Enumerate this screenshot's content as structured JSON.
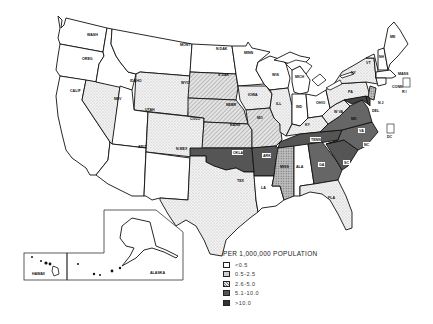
{
  "map": {
    "legend": {
      "title": "PER 1,000,000 POPULATION",
      "classes": [
        {
          "label": "<0.5",
          "fill": "#ffffff",
          "pattern": "blank"
        },
        {
          "label": "0.5-2.5",
          "fill": "#e6e6e6",
          "pattern": "light-dots"
        },
        {
          "label": "2.6-5.0",
          "fill": "#cfcfcf",
          "pattern": "diagonal-hatch"
        },
        {
          "label": "5.1-10.0",
          "fill": "#a8a8a8",
          "pattern": "dense-dots"
        },
        {
          "label": ">10.0",
          "fill": "#555555",
          "pattern": "dark-solid"
        }
      ]
    },
    "state_labels": {
      "WASH": "WASH",
      "OREG": "OREG",
      "CALIF": "CALIF",
      "NEV": "NEV",
      "IDAHO": "IDAHO",
      "MONT": "MONT",
      "WYO": "WYO",
      "UTAH": "UTAH",
      "ARIZ": "ARIZ",
      "COLO": "COLO",
      "NMEX": "N MEX",
      "NDAK": "N DAK",
      "SDAK": "S DAK",
      "NEBR": "NEBR",
      "KANS": "KANS",
      "OKLA": "OKLA",
      "TEX": "TEX",
      "MINN": "MINN",
      "IOWA": "IOWA",
      "MO": "MO",
      "ARK": "ARK",
      "LA": "LA",
      "WIS": "WIS",
      "ILL": "ILL",
      "MICH": "MICH",
      "IND": "IND",
      "OHIO": "OHIO",
      "KY": "KY",
      "TENN": "TENN",
      "MISS": "MISS",
      "ALA": "ALA",
      "GA": "GA",
      "FLA": "FLA",
      "SC": "SC",
      "NC": "NC",
      "VA": "VA",
      "WVA": "W VA",
      "PA": "PA",
      "NY": "NY",
      "VT": "VT",
      "NH": "NH",
      "ME": "ME",
      "MASS": "MASS",
      "CONN": "CONN",
      "RI": "R I",
      "NJ": "N J",
      "DEL": "DEL",
      "MD": "MD",
      "DC": "DC",
      "HAWAII": "HAWAII",
      "ALASKA": "ALASKA"
    },
    "state_classes": {
      "WASH": "<0.5",
      "OREG": "<0.5",
      "CALIF": "<0.5",
      "NEV": "0.5-2.5",
      "IDAHO": "<0.5",
      "MONT": "<0.5",
      "WYO": "0.5-2.5",
      "UTAH": "0.5-2.5",
      "ARIZ": "<0.5",
      "COLO": "0.5-2.5",
      "NMEX": "<0.5",
      "NDAK": "<0.5",
      "SDAK": "2.6-5.0",
      "NEBR": "2.6-5.0",
      "KANS": "2.6-5.0",
      "OKLA": ">10.0",
      "TEX": "0.5-2.5",
      "MINN": "<0.5",
      "IOWA": "0.5-2.5",
      "MO": "2.6-5.0",
      "ARK": ">10.0",
      "LA": "<0.5",
      "WIS": "<0.5",
      "ILL": "0.5-2.5",
      "MICH": "<0.5",
      "IND": "<0.5",
      "OHIO": "<0.5",
      "KY": "0.5-2.5",
      "TENN": ">10.0",
      "MISS": "5.1-10.0",
      "ALA": "<0.5",
      "GA": ">10.0",
      "FLA": "0.5-2.5",
      "SC": ">10.0",
      "NC": ">10.0",
      "VA": ">10.0",
      "WVA": "0.5-2.5",
      "PA": "0.5-2.5",
      "NY": "0.5-2.5",
      "VT": "<0.5",
      "NH": "<0.5",
      "ME": "<0.5",
      "MASS": "<0.5",
      "CONN": "<0.5",
      "RI": "<0.5",
      "NJ": "5.1-10.0",
      "DEL": ">10.0",
      "MD": ">10.0",
      "DC": "<0.5",
      "HAWAII": "<0.5",
      "ALASKA": "<0.5"
    }
  }
}
